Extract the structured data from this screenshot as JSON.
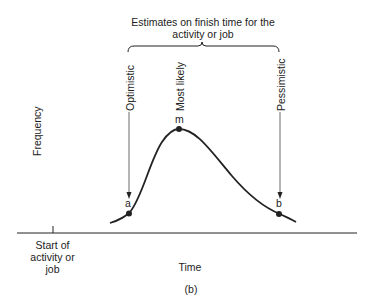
{
  "figure": {
    "title_line1": "Estimates on finish time for the",
    "title_line2": "activity or job",
    "estimates": {
      "optimistic": "Optimistic",
      "most_likely": "Most likely",
      "pessimistic": "Pessimistic"
    },
    "points": {
      "a": "a",
      "m": "m",
      "b": "b"
    },
    "y_label": "Frequency",
    "x_label": "Time",
    "start_label_line1": "Start of",
    "start_label_line2": "activity or",
    "start_label_line3": "job",
    "caption": "(b)",
    "colors": {
      "ink": "#222222",
      "background": "#ffffff"
    }
  }
}
